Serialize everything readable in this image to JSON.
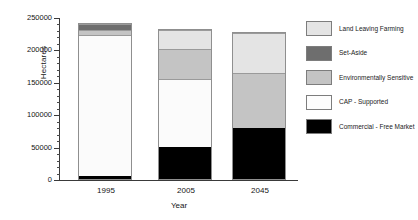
{
  "chart_data": {
    "type": "bar",
    "stacked": true,
    "title": "",
    "xlabel": "Year",
    "ylabel": "Hectares",
    "categories": [
      "1995",
      "2005",
      "2045"
    ],
    "ylim": [
      0,
      250000
    ],
    "ytick_labels": [
      "0",
      "50000",
      "100000",
      "150000",
      "200000",
      "250000"
    ],
    "ytick_values": [
      0,
      50000,
      100000,
      150000,
      200000,
      250000
    ],
    "minor_tick_interval": 10000,
    "grid": false,
    "legend_position": "right",
    "series": [
      {
        "name": "Commercial - Free Market",
        "color": "#000000",
        "values": [
          5000,
          50000,
          78000
        ]
      },
      {
        "name": "CAP - Supported",
        "color": "#fbfbfb",
        "values": [
          217000,
          105000,
          0
        ]
      },
      {
        "name": "Environmentally Sensitive",
        "color": "#c4c4c4",
        "values": [
          8000,
          45000,
          85000
        ]
      },
      {
        "name": "Set-Aside",
        "color": "#6e6e6e",
        "values": [
          10000,
          0,
          0
        ]
      },
      {
        "name": "Land Leaving Farming",
        "color": "#e4e4e4",
        "values": [
          0,
          30000,
          62000
        ]
      }
    ],
    "totals": [
      240000,
      230000,
      225000
    ]
  },
  "legend": {
    "items": [
      {
        "label": "Land Leaving Farming",
        "color": "#e4e4e4"
      },
      {
        "label": "Set-Aside",
        "color": "#6e6e6e"
      },
      {
        "label": "Environmentally Sensitive",
        "color": "#c4c4c4"
      },
      {
        "label": "CAP - Supported",
        "color": "#fdfdfd"
      },
      {
        "label": "Commercial - Free Market",
        "color": "#000000"
      }
    ]
  }
}
